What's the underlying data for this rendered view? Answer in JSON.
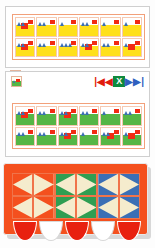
{
  "app": {
    "title": "Pattern Blocks Builder",
    "background": "#ffffff"
  },
  "colors": {
    "red": "#f22b13",
    "yellow": "#ffe01b",
    "green": "#55b646",
    "blue": "#3b6fb5",
    "orange": "#f4501e",
    "cream": "#f5eccd",
    "panel_border": "#cfcfcf",
    "frame_border": "#f2a07a"
  },
  "panels": [
    {
      "name": "yellow-pattern-panel",
      "base_color_name": "yellow",
      "rows": 2,
      "columns": 6,
      "tiles": [
        {
          "id": "t1",
          "blocks": 2,
          "triangles": 2
        },
        {
          "id": "t2",
          "blocks": 1,
          "triangles": 2
        },
        {
          "id": "t3",
          "blocks": 1,
          "triangles": 1
        },
        {
          "id": "t4",
          "blocks": 1,
          "triangles": 2
        },
        {
          "id": "t5",
          "blocks": 1,
          "triangles": 1
        },
        {
          "id": "t6",
          "blocks": 1,
          "triangles": 1
        },
        {
          "id": "t7",
          "blocks": 2,
          "triangles": 2
        },
        {
          "id": "t8",
          "blocks": 1,
          "triangles": 2
        },
        {
          "id": "t9",
          "blocks": 1,
          "triangles": 3
        },
        {
          "id": "t10",
          "blocks": 2,
          "triangles": 2
        },
        {
          "id": "t11",
          "blocks": 1,
          "triangles": 2
        },
        {
          "id": "t12",
          "blocks": 2,
          "triangles": 1
        }
      ]
    },
    {
      "name": "green-pattern-panel",
      "base_color_name": "green",
      "rows": 2,
      "columns": 6,
      "tiles": [
        {
          "id": "g1",
          "blocks": 2,
          "triangles": 2
        },
        {
          "id": "g2",
          "blocks": 1,
          "triangles": 2
        },
        {
          "id": "g3",
          "blocks": 2,
          "triangles": 2
        },
        {
          "id": "g4",
          "blocks": 1,
          "triangles": 2
        },
        {
          "id": "g5",
          "blocks": 1,
          "triangles": 1
        },
        {
          "id": "g6",
          "blocks": 1,
          "triangles": 2
        },
        {
          "id": "g7",
          "blocks": 1,
          "triangles": 2
        },
        {
          "id": "g8",
          "blocks": 1,
          "triangles": 2
        },
        {
          "id": "g9",
          "blocks": 2,
          "triangles": 2
        },
        {
          "id": "g10",
          "blocks": 1,
          "triangles": 1
        },
        {
          "id": "g11",
          "blocks": 2,
          "triangles": 2
        },
        {
          "id": "g12",
          "blocks": 2,
          "triangles": 1
        }
      ]
    }
  ],
  "thumbnails": [
    {
      "name": "yellow-pattern-thumbnail",
      "base_color_name": "yellow"
    },
    {
      "name": "green-pattern-thumbnail",
      "base_color_name": "green"
    }
  ],
  "selection_dot": {
    "name": "selection-dot",
    "color": "#3a3a3a"
  },
  "pager": {
    "first_label": "|◀",
    "prev_label": "◀",
    "page_label": "X",
    "next_label": "▶",
    "last_label": "▶|",
    "first_color": "#e11b0c",
    "prev_color": "#e11b0c",
    "page_bg": "#0f8a3d",
    "next_color": "#2f5fbf",
    "last_color": "#2f5fbf"
  },
  "vehicle": {
    "name": "pattern-vehicle-canvas",
    "body_color": "#f4501e",
    "cargo_rows": 2,
    "cargo_columns": 6,
    "cargo_cells": [
      {
        "id": "c1",
        "color_name": "orange",
        "color": "#f4501e",
        "shape": "wedge-right"
      },
      {
        "id": "c2",
        "color_name": "orange",
        "color": "#f4501e",
        "shape": "wedge-left"
      },
      {
        "id": "c3",
        "color_name": "green",
        "color": "#2f9e52",
        "shape": "wedge-right"
      },
      {
        "id": "c4",
        "color_name": "green",
        "color": "#2f9e52",
        "shape": "wedge-left"
      },
      {
        "id": "c5",
        "color_name": "blue",
        "color": "#3b6fb5",
        "shape": "wedge-right"
      },
      {
        "id": "c6",
        "color_name": "blue",
        "color": "#3b6fb5",
        "shape": "wedge-left"
      },
      {
        "id": "c7",
        "color_name": "orange",
        "color": "#f4501e",
        "shape": "wedge-right"
      },
      {
        "id": "c8",
        "color_name": "orange",
        "color": "#f4501e",
        "shape": "wedge-left"
      },
      {
        "id": "c9",
        "color_name": "green",
        "color": "#2f9e52",
        "shape": "wedge-right"
      },
      {
        "id": "c10",
        "color_name": "green",
        "color": "#2f9e52",
        "shape": "wedge-left"
      },
      {
        "id": "c11",
        "color_name": "blue",
        "color": "#3b6fb5",
        "shape": "wedge-right"
      },
      {
        "id": "c12",
        "color_name": "blue",
        "color": "#3b6fb5",
        "shape": "wedge-left"
      }
    ],
    "wheels": [
      {
        "id": "w1",
        "color_name": "red",
        "color": "#e8200f"
      },
      {
        "id": "w2",
        "color_name": "white",
        "color": "#ffffff"
      },
      {
        "id": "w3",
        "color_name": "red",
        "color": "#e8200f"
      },
      {
        "id": "w4",
        "color_name": "white",
        "color": "#ffffff"
      },
      {
        "id": "w5",
        "color_name": "red",
        "color": "#e8200f"
      }
    ]
  }
}
